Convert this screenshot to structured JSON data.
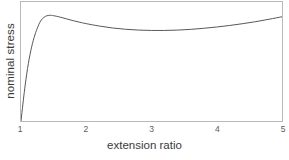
{
  "chart_data": {
    "type": "line",
    "title": "",
    "subtitle": "",
    "xlabel": "extension ratio",
    "ylabel": "nominal stress",
    "xlim": [
      1,
      5
    ],
    "ylim": [
      0,
      1
    ],
    "xticks": [
      1,
      2,
      3,
      4,
      5
    ],
    "xtick_labels": [
      "1",
      "2",
      "3",
      "4",
      "5"
    ],
    "yticks": [],
    "ytick_labels": [],
    "grid": false,
    "legend": null,
    "annotations": [],
    "series": [
      {
        "name": "nominal stress curve",
        "color": "#555555",
        "linewidth": 1,
        "x": [
          1.0,
          1.05,
          1.1,
          1.15,
          1.2,
          1.25,
          1.3,
          1.35,
          1.4,
          1.45,
          1.5,
          1.6,
          1.7,
          1.8,
          1.9,
          2.0,
          2.2,
          2.4,
          2.6,
          2.8,
          3.0,
          3.2,
          3.4,
          3.6,
          3.8,
          4.0,
          4.2,
          4.4,
          4.6,
          4.8,
          5.0
        ],
        "y": [
          0.0,
          0.24,
          0.44,
          0.59,
          0.7,
          0.78,
          0.84,
          0.87,
          0.885,
          0.888,
          0.885,
          0.873,
          0.858,
          0.843,
          0.83,
          0.818,
          0.798,
          0.782,
          0.771,
          0.764,
          0.761,
          0.761,
          0.764,
          0.77,
          0.779,
          0.79,
          0.803,
          0.818,
          0.835,
          0.855,
          0.876
        ]
      }
    ],
    "features": {
      "peak_x": 1.45,
      "peak_y": 0.888,
      "minimum_x": 3.1,
      "minimum_y": 0.761,
      "start_x": 1.0,
      "start_y": 0.0,
      "end_x": 5.0,
      "end_y": 0.876
    }
  },
  "axes": {
    "frame_color": "#b9b9b9",
    "background": "#ffffff"
  }
}
